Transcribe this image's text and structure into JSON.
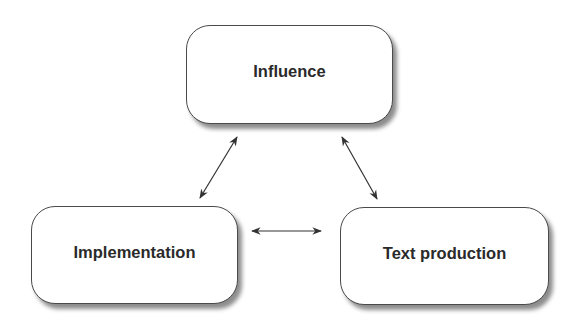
{
  "diagram": {
    "nodes": [
      {
        "id": "influence",
        "label": "Influence"
      },
      {
        "id": "implementation",
        "label": "Implementation"
      },
      {
        "id": "text_production",
        "label": "Text production"
      }
    ],
    "edges": [
      {
        "from": "influence",
        "to": "implementation",
        "type": "bidirectional"
      },
      {
        "from": "influence",
        "to": "text_production",
        "type": "bidirectional"
      },
      {
        "from": "implementation",
        "to": "text_production",
        "type": "bidirectional"
      }
    ],
    "colors": {
      "border": "#4a4a4a",
      "text": "#2a2a2a",
      "arrow": "#333333",
      "background": "#ffffff"
    }
  }
}
